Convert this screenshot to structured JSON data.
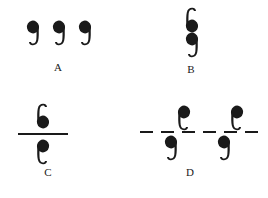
{
  "figure": {
    "type": "symmetry-operation-diagram",
    "background_color": "#ffffff",
    "ink_color": "#1a1a1a",
    "width": 268,
    "height": 198,
    "panels": [
      {
        "id": "A",
        "label": "A",
        "label_x": 48,
        "label_y": 62,
        "operation": "translation",
        "description": "Three identical note glyphs repeated at equal spacing, all in the same orientation.",
        "rule": null,
        "glyphs": [
          {
            "name": "note-a-1",
            "orientation": "upright",
            "x": 22,
            "y": 18,
            "side": "none"
          },
          {
            "name": "note-a-2",
            "orientation": "upright",
            "x": 48,
            "y": 18,
            "side": "none"
          },
          {
            "name": "note-a-3",
            "orientation": "upright",
            "x": 74,
            "y": 18,
            "side": "none"
          }
        ]
      },
      {
        "id": "B",
        "label": "B",
        "label_x": 181,
        "label_y": 64,
        "operation": "inversion",
        "description": "Two note glyphs stacked vertically; the upper one is rotated 180 degrees relative to the lower.",
        "rule": null,
        "glyphs": [
          {
            "name": "note-b-1",
            "orientation": "rotated-180",
            "x": 181,
            "y": 5,
            "side": "none"
          },
          {
            "name": "note-b-2",
            "orientation": "upright",
            "x": 181,
            "y": 30,
            "side": "none"
          }
        ]
      },
      {
        "id": "C",
        "label": "C",
        "label_x": 38,
        "label_y": 167,
        "operation": "mirror-plane",
        "description": "A note glyph above a solid horizontal line and its mirror image reflected below the line.",
        "rule": {
          "style": "solid",
          "x": 18,
          "y": 133,
          "width": 50,
          "thickness": 2
        },
        "glyphs": [
          {
            "name": "note-c-1",
            "orientation": "rotated-180",
            "x": 32,
            "y": 101,
            "side": "above"
          },
          {
            "name": "note-c-2",
            "orientation": "mirrored",
            "x": 32,
            "y": 137,
            "side": "below"
          }
        ]
      },
      {
        "id": "D",
        "label": "D",
        "label_x": 180,
        "label_y": 167,
        "operation": "glide-plane",
        "description": "A dashed horizontal line with note glyphs alternating above and below it, each reflected and shifted by half a repeat.",
        "rule": {
          "style": "dashed",
          "x": 140,
          "y": 131,
          "width": 118,
          "thickness": 2,
          "dash_count": 6,
          "dash_length": 13,
          "dash_gap": 8
        },
        "glyphs": [
          {
            "name": "note-d-1",
            "orientation": "mirrored",
            "x": 173,
            "y": 103,
            "side": "above"
          },
          {
            "name": "note-d-2",
            "orientation": "upright",
            "x": 160,
            "y": 133,
            "side": "below"
          },
          {
            "name": "note-d-3",
            "orientation": "mirrored",
            "x": 226,
            "y": 103,
            "side": "above"
          },
          {
            "name": "note-d-4",
            "orientation": "upright",
            "x": 213,
            "y": 133,
            "side": "below"
          }
        ]
      }
    ]
  }
}
